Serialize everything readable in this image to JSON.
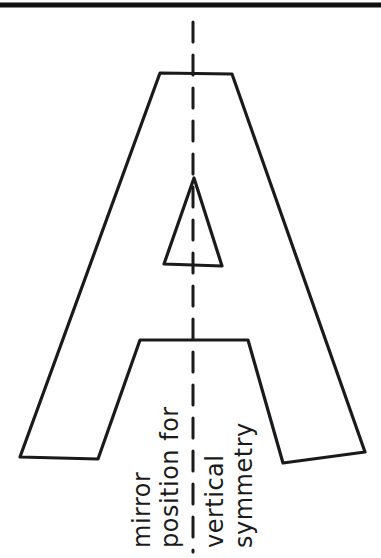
{
  "diagram": {
    "annotation_lines": [
      "mirror",
      "position for",
      "vertical",
      "symmetry"
    ],
    "axis": "vertical line of symmetry (dashed)",
    "colors": {
      "ink": "#1a1a1a",
      "background": "#ffffff"
    }
  }
}
